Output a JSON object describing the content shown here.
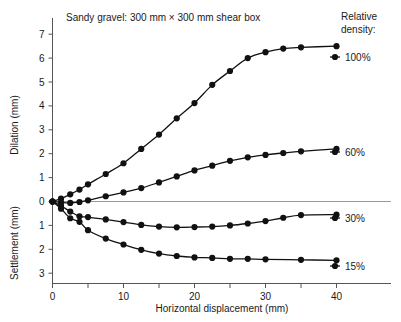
{
  "chart_data": {
    "type": "line",
    "title": "Sandy gravel: 300 mm × 300 mm shear box",
    "xlabel": "Horizontal displacement (mm)",
    "ylabel_upper": "Dilation (mm)",
    "ylabel_lower": "Settlement (mm)",
    "legend_title_line1": "Relative",
    "legend_title_line2": "density:",
    "legend_position": "right",
    "grid": false,
    "xlim": [
      0,
      41
    ],
    "xticks": [
      0,
      5,
      10,
      15,
      20,
      25,
      30,
      35,
      40
    ],
    "xtick_labels": [
      "0",
      "",
      "10",
      "",
      "20",
      "",
      "30",
      "",
      "40"
    ],
    "yticks_upper": [
      1,
      2,
      3,
      4,
      5,
      6,
      7
    ],
    "yticks_lower": [
      1,
      2,
      3
    ],
    "ytick_labels_upper": [
      "1",
      "2",
      "3",
      "4",
      "5",
      "6",
      "7"
    ],
    "ytick_labels_lower": [
      "1",
      "2",
      "3"
    ],
    "ylim": [
      -3,
      7.4
    ],
    "note": "Positive y = dilation (mm), negative y = settlement (mm). Settlement axis labels are shown unsigned.",
    "series": [
      {
        "name": "100%",
        "label": "100%",
        "color": "#111111",
        "legend_y": 57,
        "x": [
          0,
          1.2,
          2.5,
          3.8,
          5,
          7.5,
          10,
          12.5,
          15,
          17.5,
          20,
          22.5,
          25,
          27.5,
          30,
          32.5,
          35,
          40
        ],
        "y": [
          0,
          0.12,
          0.3,
          0.5,
          0.72,
          1.15,
          1.6,
          2.2,
          2.8,
          3.48,
          4.12,
          4.88,
          5.46,
          6.0,
          6.25,
          6.4,
          6.45,
          6.5
        ]
      },
      {
        "name": "60%",
        "label": "60%",
        "color": "#111111",
        "legend_y": 152,
        "x": [
          0,
          1.2,
          2.5,
          3.8,
          5,
          7.5,
          10,
          12.5,
          15,
          17.5,
          20,
          22.5,
          25,
          27.5,
          30,
          32.5,
          35,
          40
        ],
        "y": [
          0,
          -0.04,
          -0.06,
          -0.02,
          0.05,
          0.22,
          0.38,
          0.56,
          0.8,
          1.05,
          1.3,
          1.5,
          1.7,
          1.85,
          1.95,
          2.03,
          2.1,
          2.2
        ]
      },
      {
        "name": "30%",
        "label": "30%",
        "color": "#111111",
        "legend_y": 218,
        "x": [
          0,
          1.2,
          2.5,
          3.8,
          5,
          7.5,
          10,
          12.5,
          15,
          17.5,
          20,
          22.5,
          25,
          27.5,
          30,
          32.5,
          35,
          40
        ],
        "y": [
          0,
          -0.18,
          -0.42,
          -0.62,
          -0.65,
          -0.75,
          -0.86,
          -0.98,
          -1.05,
          -1.08,
          -1.07,
          -1.05,
          -1.0,
          -0.92,
          -0.82,
          -0.68,
          -0.57,
          -0.55
        ]
      },
      {
        "name": "15%",
        "label": "15%",
        "color": "#111111",
        "legend_y": 266,
        "x": [
          0,
          1.2,
          2.5,
          3.8,
          5,
          7.5,
          10,
          12.5,
          15,
          17.5,
          20,
          22.5,
          25,
          27.5,
          30,
          35,
          40
        ],
        "y": [
          0,
          -0.3,
          -0.7,
          -0.85,
          -1.2,
          -1.55,
          -1.8,
          -2.02,
          -2.18,
          -2.28,
          -2.34,
          -2.36,
          -2.4,
          -2.4,
          -2.42,
          -2.44,
          -2.46
        ]
      }
    ]
  }
}
